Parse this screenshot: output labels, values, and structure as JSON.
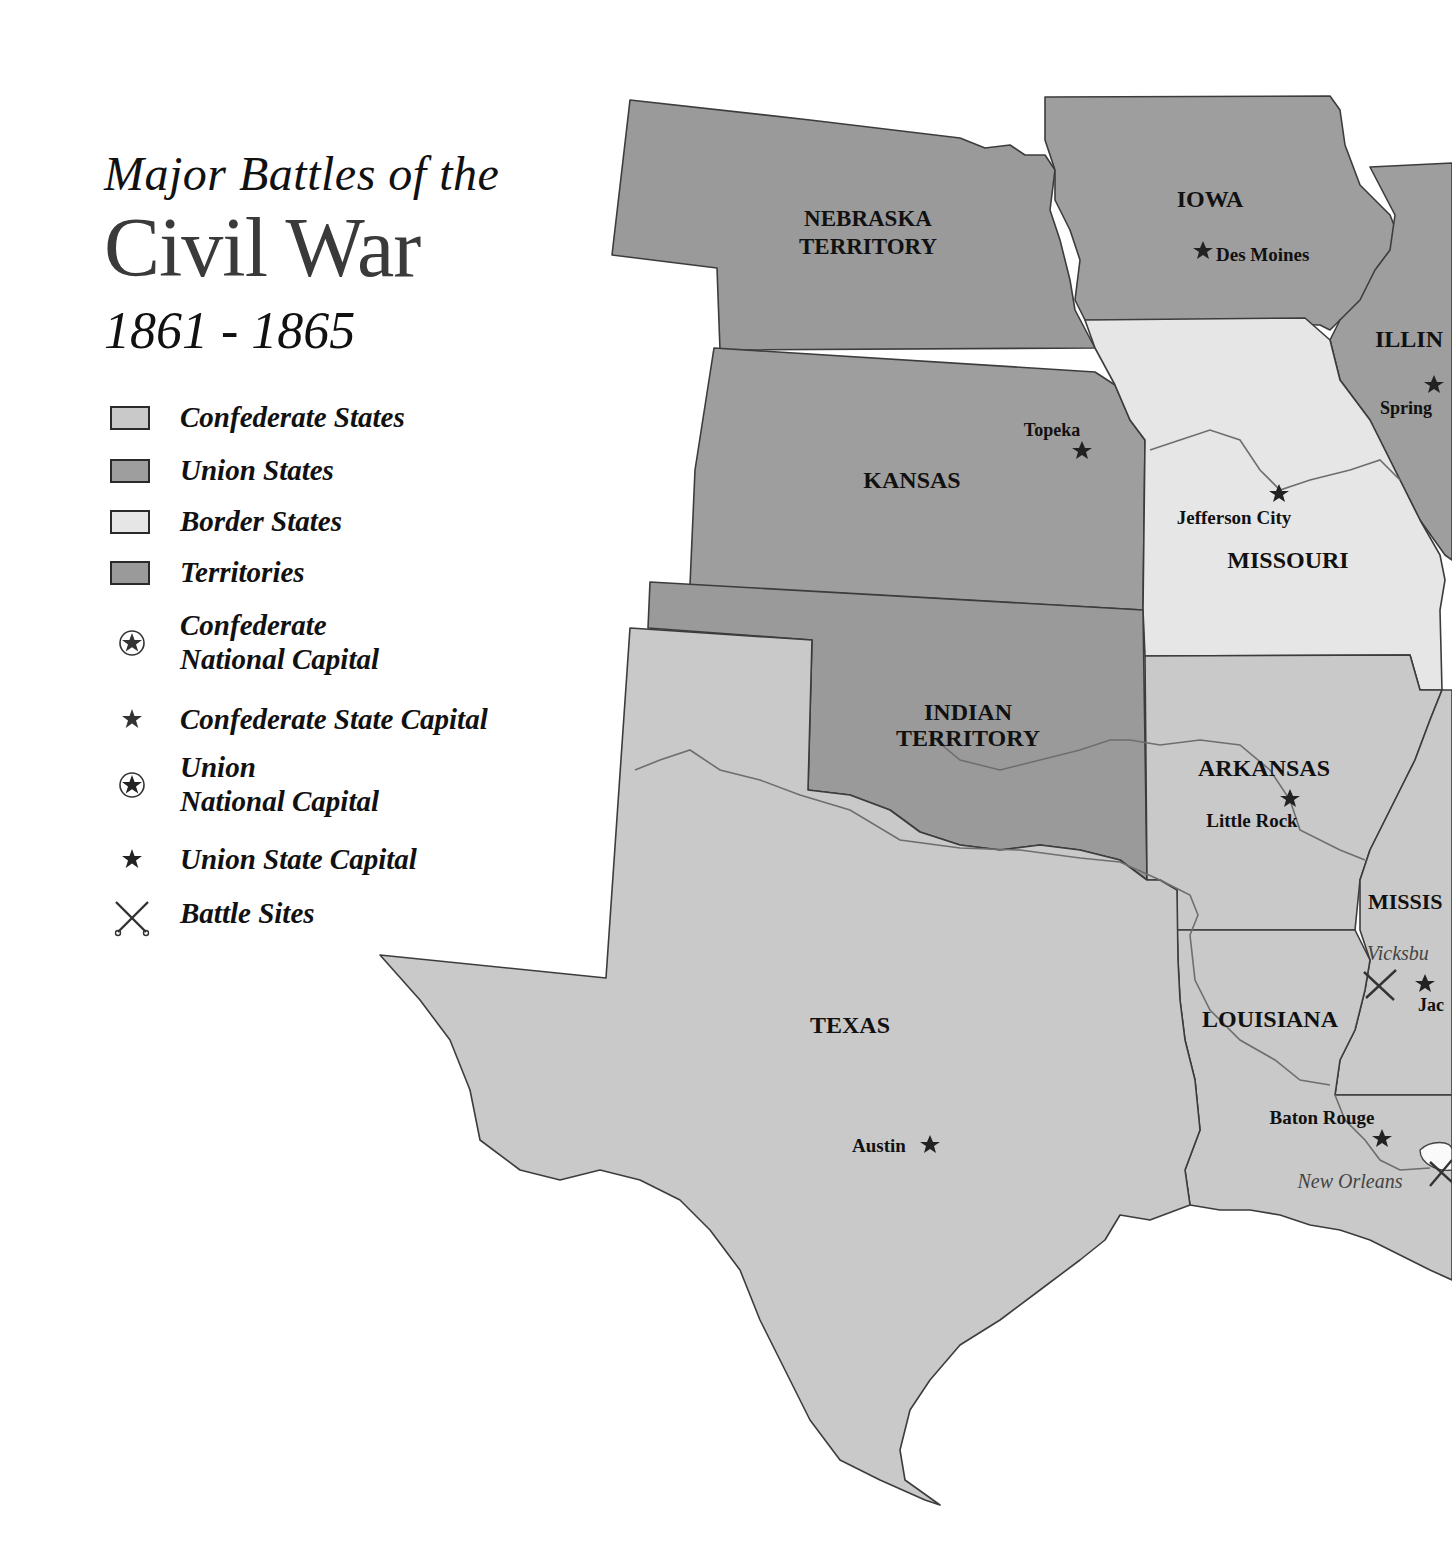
{
  "title": {
    "line1": "Major Battles of the",
    "line2": "Civil War",
    "line3": "1861 - 1865"
  },
  "colors": {
    "confederate": "#c9c9c9",
    "union": "#9e9e9e",
    "border": "#e6e6e6",
    "territory": "#9a9a9a",
    "outline": "#3c3c3c",
    "river": "#6e6e6e"
  },
  "legend": {
    "items": [
      {
        "label": "Confederate States",
        "symbol": "swatch-confederate"
      },
      {
        "label": "Union States",
        "symbol": "swatch-union"
      },
      {
        "label": "Border States",
        "symbol": "swatch-border"
      },
      {
        "label": "Territories",
        "symbol": "swatch-territory"
      },
      {
        "label_line1": "Confederate",
        "label_line2": "National Capital",
        "symbol": "circled-star-icon"
      },
      {
        "label": "Confederate State Capital",
        "symbol": "star-icon"
      },
      {
        "label_line1": "Union",
        "label_line2": "National Capital",
        "symbol": "circled-star-icon"
      },
      {
        "label": "Union State Capital",
        "symbol": "star-icon"
      },
      {
        "label": "Battle Sites",
        "symbol": "crossed-swords-icon"
      }
    ]
  },
  "map": {
    "regions": [
      {
        "name": "NEBRASKA",
        "name2": "TERRITORY",
        "type": "territory"
      },
      {
        "name": "IOWA",
        "type": "union"
      },
      {
        "name": "ILLIN",
        "type": "union"
      },
      {
        "name": "KANSAS",
        "type": "union"
      },
      {
        "name": "MISSOURI",
        "type": "border"
      },
      {
        "name": "INDIAN",
        "name2": "TERRITORY",
        "type": "territory"
      },
      {
        "name": "ARKANSAS",
        "type": "confederate"
      },
      {
        "name": "MISSIS",
        "type": "confederate"
      },
      {
        "name": "TEXAS",
        "type": "confederate"
      },
      {
        "name": "LOUISIANA",
        "type": "confederate"
      }
    ],
    "capitals": [
      {
        "name": "Des Moines",
        "type": "union-state-capital"
      },
      {
        "name": "Spring",
        "type": "union-state-capital"
      },
      {
        "name": "Topeka",
        "type": "union-state-capital"
      },
      {
        "name": "Jefferson City",
        "type": "state-capital"
      },
      {
        "name": "Little Rock",
        "type": "confederate-state-capital"
      },
      {
        "name": "Jac",
        "type": "confederate-state-capital"
      },
      {
        "name": "Austin",
        "type": "confederate-state-capital"
      },
      {
        "name": "Baton Rouge",
        "type": "confederate-state-capital"
      }
    ],
    "battles": [
      {
        "name": "Vicksbu"
      },
      {
        "name": "New Orleans"
      }
    ]
  }
}
